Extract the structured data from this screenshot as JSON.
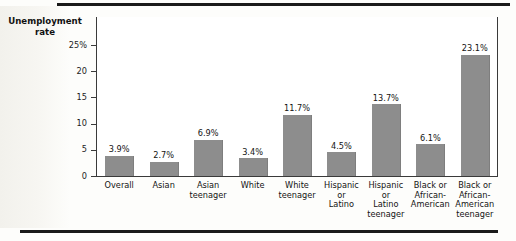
{
  "figure": {
    "watermark_top": "REVIEW",
    "watermark_bottom": "Economics"
  },
  "chart_data": {
    "type": "bar",
    "title": "",
    "xlabel": "",
    "ylabel": "Unemployment rate",
    "ylabel_line1": "Unemployment",
    "ylabel_line2": "rate",
    "ylim": [
      0,
      26.5
    ],
    "grid": false,
    "legend": "none",
    "bar_color": "#8d8d8d",
    "yticks": [
      0,
      5,
      10,
      15,
      20,
      25
    ],
    "ytick_labels": [
      "0",
      "5",
      "10",
      "15",
      "20",
      "25%"
    ],
    "categories": [
      "Overall",
      "Asian",
      "Asian teenager",
      "White",
      "White teenager",
      "Hispanic or Latino",
      "Hispanic or Latino teenager",
      "Black or African-American",
      "Black or African-American teenager"
    ],
    "category_lines": [
      [
        "Overall"
      ],
      [
        "Asian"
      ],
      [
        "Asian",
        "teenager"
      ],
      [
        "White"
      ],
      [
        "White",
        "teenager"
      ],
      [
        "Hispanic",
        "or",
        "Latino"
      ],
      [
        "Hispanic",
        "or",
        "Latino",
        "teenager"
      ],
      [
        "Black or",
        "African-",
        "American"
      ],
      [
        "Black or",
        "African-",
        "American",
        "teenager"
      ]
    ],
    "values": [
      3.9,
      2.7,
      6.9,
      3.4,
      11.7,
      4.5,
      13.7,
      6.1,
      23.1
    ],
    "value_labels": [
      "3.9%",
      "2.7%",
      "6.9%",
      "3.4%",
      "11.7%",
      "4.5%",
      "13.7%",
      "6.1%",
      "23.1%"
    ]
  }
}
